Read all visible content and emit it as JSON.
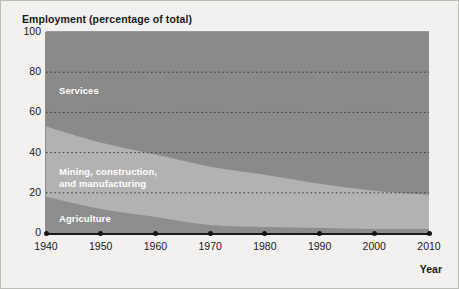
{
  "chart_data": {
    "type": "area",
    "stacked": true,
    "title": "Employment (percentage of total)",
    "xlabel": "Year",
    "ylabel": "",
    "categories": [
      1940,
      1950,
      1960,
      1970,
      1980,
      1990,
      2000,
      2010
    ],
    "x_tick_labels": [
      "1940",
      "1950",
      "1960",
      "1970",
      "1980",
      "1990",
      "2000",
      "2010"
    ],
    "y_tick_labels": [
      "0",
      "20",
      "40",
      "60",
      "80",
      "100"
    ],
    "y_ticks": [
      0,
      20,
      40,
      60,
      80,
      100
    ],
    "xlim": [
      1940,
      2010
    ],
    "ylim": [
      0,
      100
    ],
    "grid": "horizontal-dotted",
    "legend": "in-band labels",
    "series": [
      {
        "name": "Agriculture",
        "label": "Agriculture",
        "color": "#8d8d8d",
        "values": [
          18,
          12,
          8,
          4,
          3,
          2.5,
          2,
          2
        ]
      },
      {
        "name": "Mining, construction, and manufacturing",
        "label": "Mining, construction,\nand manufacturing",
        "color": "#b2b2b2",
        "values": [
          35,
          33,
          31,
          29,
          26,
          22,
          19,
          17
        ]
      },
      {
        "name": "Services",
        "label": "Services",
        "color": "#8a8a8a",
        "values": [
          47,
          55,
          61,
          67,
          71,
          75.5,
          79,
          81
        ]
      }
    ]
  },
  "colors": {
    "background": "#f2f1ef",
    "frame_border": "#bdbcb8",
    "axis": "#1a1a1a",
    "gridline": "#3a3a3a",
    "agriculture": "#8d8d8d",
    "mining": "#b2b2b2",
    "services": "#8a8a8a",
    "label_text": "#ffffff"
  }
}
